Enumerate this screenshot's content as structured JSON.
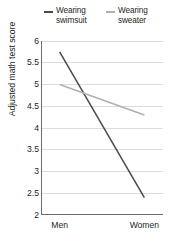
{
  "chart_data": {
    "type": "line",
    "title": "",
    "subtitle": "",
    "xlabel": "",
    "ylabel": "Adjusted math test score",
    "categories": [
      "Men",
      "Women"
    ],
    "x": [
      0,
      1
    ],
    "ylim": [
      2,
      6
    ],
    "xlim": [
      -0.22,
      1.22
    ],
    "yticks": [
      "6",
      "5.5",
      "5",
      "4.5",
      "4",
      "3.5",
      "3",
      "2.5",
      "2"
    ],
    "ytick_values": [
      6,
      5.5,
      5,
      4.5,
      4,
      3.5,
      3,
      2.5,
      2
    ],
    "grid": "horizontal",
    "legend_position": "top",
    "series": [
      {
        "name": "Wearing\nswimsuit",
        "legend_label": "Wearing swimsuit",
        "color": "#4a4a4a",
        "width": 1.5,
        "values": [
          5.75,
          2.4
        ]
      },
      {
        "name": "Wearing\nsweater",
        "legend_label": "Wearing sweater",
        "color": "#b0b0b0",
        "width": 1.5,
        "values": [
          5.0,
          4.3
        ]
      }
    ],
    "axis_color": "#6d6d6d",
    "grid_color": "#dcdcdc",
    "background": "#ffffff"
  }
}
